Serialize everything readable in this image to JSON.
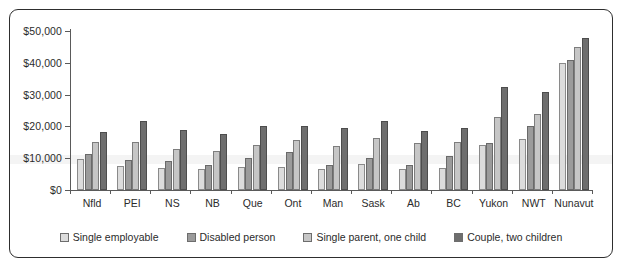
{
  "chart_data": {
    "type": "bar",
    "title": "",
    "subtitle": "",
    "xlabel": "",
    "ylabel": "",
    "ylim": [
      0,
      50000
    ],
    "ytick_values": [
      0,
      10000,
      20000,
      30000,
      40000,
      50000
    ],
    "ytick_labels": [
      "$0",
      "$10,000",
      "$20,000",
      "$30,000",
      "$40,000",
      "$50,000"
    ],
    "grid": false,
    "legend_position": "bottom",
    "categories": [
      "Nfld",
      "PEI",
      "NS",
      "NB",
      "Que",
      "Ont",
      "Man",
      "Sask",
      "Ab",
      "BC",
      "Yukon",
      "NWT",
      "Nunavut"
    ],
    "series": [
      {
        "name": "Single employable",
        "color": "#dcdcdc",
        "values": [
          9800,
          7600,
          6800,
          6500,
          7200,
          7100,
          6600,
          8100,
          6500,
          7000,
          14000,
          16000,
          40000
        ]
      },
      {
        "name": "Disabled person",
        "color": "#9b9b9b",
        "values": [
          11400,
          9300,
          9100,
          8000,
          10100,
          12000,
          8000,
          10100,
          8000,
          10600,
          14800,
          20000,
          41000
        ]
      },
      {
        "name": "Single parent, one child",
        "color": "#c6c6c6",
        "values": [
          15100,
          15100,
          13000,
          12400,
          14300,
          15700,
          13800,
          16200,
          14900,
          15000,
          23000,
          24000,
          45000
        ]
      },
      {
        "name": "Couple, two children",
        "color": "#6e6e6e",
        "values": [
          18300,
          21700,
          18900,
          17700,
          20200,
          20100,
          19400,
          21800,
          18700,
          19600,
          32300,
          30800,
          47800
        ]
      }
    ]
  },
  "legend": {
    "items": [
      {
        "label": "Single employable"
      },
      {
        "label": "Disabled person"
      },
      {
        "label": "Single parent, one child"
      },
      {
        "label": "Couple, two children"
      }
    ]
  }
}
